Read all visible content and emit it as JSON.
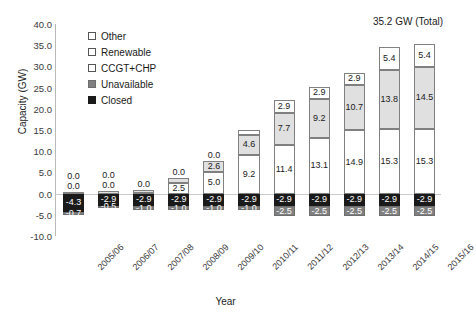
{
  "chart_data": {
    "type": "bar",
    "stacked": true,
    "title": "",
    "xlabel": "Year",
    "ylabel": "Capacity (GW)",
    "ylim": [
      -10.0,
      40.0
    ],
    "ytick_labels": [
      "40.0",
      "35.0",
      "30.0",
      "25.0",
      "20.0",
      "15.0",
      "10.0",
      "5.0",
      "0.0",
      "-5.0",
      "-10.0"
    ],
    "yticks": [
      40.0,
      35.0,
      30.0,
      25.0,
      20.0,
      15.0,
      10.0,
      5.0,
      0.0,
      -5.0,
      -10.0
    ],
    "grid": false,
    "legend_position": "upper-left-inside",
    "categories": [
      "2005/06",
      "2006/07",
      "2007/08",
      "2008/09",
      "2009/10",
      "2010/11",
      "2011/12",
      "2012/13",
      "2013/14",
      "2014/15",
      "2015/16"
    ],
    "series": [
      {
        "name": "Other",
        "color": "#ffffff",
        "values": [
          0.0,
          0.0,
          0.0,
          0.0,
          0.0,
          1.2,
          2.9,
          2.9,
          2.9,
          5.4,
          5.4
        ],
        "labels": [
          "0.0",
          "0.0",
          "0.0",
          "0.0",
          "0.0",
          "1.2",
          "2.9",
          "2.9",
          "2.9",
          "5.4",
          "5.4"
        ]
      },
      {
        "name": "Renewable",
        "color": "#e0e0e0",
        "values": [
          0.4,
          0.5,
          0.8,
          1.2,
          2.6,
          4.6,
          7.7,
          9.2,
          10.7,
          13.8,
          14.5
        ],
        "labels": [
          "0.4",
          "0.5",
          "0.8",
          "1.2",
          "2.6",
          "4.6",
          "7.7",
          "9.2",
          "10.7",
          "13.8",
          "14.5"
        ]
      },
      {
        "name": "CCGT+CHP",
        "color": "#ffffff",
        "values": [
          0.0,
          0.0,
          0.1,
          2.5,
          5.0,
          9.2,
          11.4,
          13.1,
          14.9,
          15.3,
          15.3
        ],
        "labels": [
          "0.0",
          "0.0",
          "0.1",
          "2.5",
          "5.0",
          "9.2",
          "11.4",
          "13.1",
          "14.9",
          "15.3",
          "15.3"
        ]
      },
      {
        "name": "Closed",
        "color": "#1a1a1a",
        "values": [
          -4.3,
          -2.9,
          -2.9,
          -2.9,
          -2.9,
          -2.9,
          -2.9,
          -2.9,
          -2.9,
          -2.9,
          -2.9
        ],
        "labels": [
          "-4.3",
          "-2.9",
          "-2.9",
          "-2.9",
          "-2.9",
          "-2.9",
          "-2.9",
          "-2.9",
          "-2.9",
          "-2.9",
          "-2.9"
        ]
      },
      {
        "name": "Unavailable",
        "color": "#808080",
        "values": [
          -0.7,
          -0.5,
          -1.0,
          -1.0,
          -1.0,
          -1.0,
          -2.5,
          -2.5,
          -2.5,
          -2.5,
          -2.5
        ],
        "labels": [
          "-0.7",
          "-0.5",
          "-1.0",
          "-1.0",
          "-1.0",
          "-1.0",
          "-2.5",
          "-2.5",
          "-2.5",
          "-2.5",
          "-2.5"
        ]
      }
    ],
    "annotations": [
      {
        "text": "35.2 GW (Total)",
        "target_category": "2015/16"
      }
    ]
  },
  "legend": {
    "items": [
      {
        "label": "Other",
        "swatch": "open-square-white"
      },
      {
        "label": "Renewable",
        "swatch": "open-square-white"
      },
      {
        "label": "CCGT+CHP",
        "swatch": "open-square-white"
      },
      {
        "label": "Unavailable",
        "swatch": "filled-square-gray"
      },
      {
        "label": "Closed",
        "swatch": "filled-square-black"
      }
    ]
  }
}
